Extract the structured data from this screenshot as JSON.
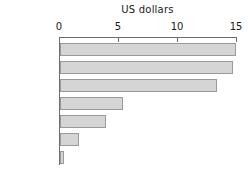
{
  "chart_data": {
    "type": "bar",
    "orientation": "horizontal",
    "title": "US dollars",
    "xlabel": "US dollars",
    "ylabel": "",
    "categories": [
      "Germany",
      "UK",
      "US",
      "Greece",
      "Portugal",
      "Mexico",
      "Sri Lanka"
    ],
    "values": [
      14.9,
      14.7,
      13.3,
      5.3,
      3.9,
      1.6,
      0.35
    ],
    "xlim": [
      0,
      15
    ],
    "xticks": [
      0,
      5,
      10,
      15
    ],
    "xtick_labels": [
      "0",
      "5",
      "10",
      "15"
    ],
    "grid": false,
    "legend": false,
    "axis_position": "top",
    "bar_color": "#d5d5d5",
    "bar_edge_color": "#9a9a9a",
    "axis_color": "#6e6e6e",
    "text_color": "#1a1a1a"
  }
}
